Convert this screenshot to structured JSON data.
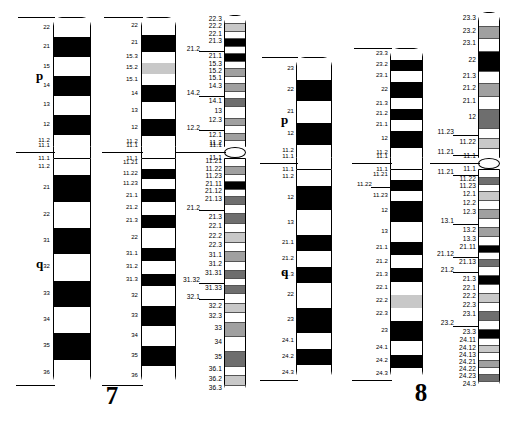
{
  "figure": {
    "type": "chromosome-ideogram",
    "arm_labels": {
      "p": "p",
      "q": "q"
    }
  },
  "chromosomes": [
    {
      "number": "7",
      "arms": {
        "p": "p",
        "q": "q"
      },
      "resolutions": [
        {
          "level": "400",
          "p_bands": [
            {
              "label": "22",
              "stain": "gneg"
            },
            {
              "label": "21",
              "stain": "gpos100"
            },
            {
              "label": "15",
              "stain": "gneg"
            },
            {
              "label": "14",
              "stain": "gpos100"
            },
            {
              "label": "13",
              "stain": "gneg"
            },
            {
              "label": "12",
              "stain": "gpos100"
            },
            {
              "label": "11.2",
              "stain": "gneg"
            },
            {
              "label": "11.1",
              "stain": "acen"
            }
          ],
          "q_bands": [
            {
              "label": "11.1",
              "stain": "acen"
            },
            {
              "label": "11.2",
              "stain": "gneg"
            },
            {
              "label": "21",
              "stain": "gpos100"
            },
            {
              "label": "22",
              "stain": "gneg"
            },
            {
              "label": "31",
              "stain": "gpos100"
            },
            {
              "label": "32",
              "stain": "gneg"
            },
            {
              "label": "33",
              "stain": "gpos100"
            },
            {
              "label": "34",
              "stain": "gneg"
            },
            {
              "label": "35",
              "stain": "gpos100"
            },
            {
              "label": "36",
              "stain": "gneg"
            }
          ]
        },
        {
          "level": "550",
          "p_bands": [
            {
              "label": "22",
              "stain": "gneg"
            },
            {
              "label": "21",
              "stain": "gpos100"
            },
            {
              "label": "15.3",
              "stain": "gneg"
            },
            {
              "label": "15.2",
              "stain": "gpos25"
            },
            {
              "label": "15.1",
              "stain": "gneg"
            },
            {
              "label": "14",
              "stain": "gpos100"
            },
            {
              "label": "13",
              "stain": "gneg"
            },
            {
              "label": "12",
              "stain": "gpos100"
            },
            {
              "label": "11.2",
              "stain": "gneg"
            },
            {
              "label": "11.1",
              "stain": "acen"
            }
          ],
          "q_bands": [
            {
              "label": "11.1",
              "stain": "acen"
            },
            {
              "label": "11.21",
              "stain": "gneg"
            },
            {
              "label": "11.22",
              "stain": "gpos100"
            },
            {
              "label": "11.23",
              "stain": "gneg"
            },
            {
              "label": "21.1",
              "stain": "gpos100"
            },
            {
              "label": "21.2",
              "stain": "gneg"
            },
            {
              "label": "21.3",
              "stain": "gpos100"
            },
            {
              "label": "22",
              "stain": "gneg"
            },
            {
              "label": "31.1",
              "stain": "gpos100"
            },
            {
              "label": "31.2",
              "stain": "gneg"
            },
            {
              "label": "31.3",
              "stain": "gpos100"
            },
            {
              "label": "32",
              "stain": "gneg"
            },
            {
              "label": "33",
              "stain": "gpos100"
            },
            {
              "label": "34",
              "stain": "gneg"
            },
            {
              "label": "35",
              "stain": "gpos100"
            },
            {
              "label": "36",
              "stain": "gneg"
            }
          ]
        },
        {
          "level": "850",
          "p_bands": [
            {
              "label": "22.3",
              "stain": "gneg"
            },
            {
              "label": "22.2",
              "stain": "gpos25"
            },
            {
              "label": "22.1",
              "stain": "gneg"
            },
            {
              "label": "21.3",
              "stain": "gpos100"
            },
            {
              "label": "21.2",
              "stain": "gneg",
              "offset": true
            },
            {
              "label": "21.1",
              "stain": "gpos100"
            },
            {
              "label": "15.3",
              "stain": "gneg"
            },
            {
              "label": "15.2",
              "stain": "gpos50"
            },
            {
              "label": "15.1",
              "stain": "gneg"
            },
            {
              "label": "14.3",
              "stain": "gpos50"
            },
            {
              "label": "14.2",
              "stain": "gneg",
              "offset": true
            },
            {
              "label": "14.1",
              "stain": "gpos75"
            },
            {
              "label": "13",
              "stain": "gneg"
            },
            {
              "label": "12.3",
              "stain": "gpos50"
            },
            {
              "label": "12.2",
              "stain": "gneg",
              "offset": true
            },
            {
              "label": "12.1",
              "stain": "gpos50"
            },
            {
              "label": "11.2",
              "stain": "gneg"
            },
            {
              "label": "11.1",
              "stain": "acen"
            }
          ],
          "q_bands": [
            {
              "label": "11.1",
              "stain": "acen"
            },
            {
              "label": "11.21",
              "stain": "gneg"
            },
            {
              "label": "11.22",
              "stain": "gpos50"
            },
            {
              "label": "11.23",
              "stain": "gneg"
            },
            {
              "label": "21.11",
              "stain": "gpos100"
            },
            {
              "label": "21.12",
              "stain": "gneg"
            },
            {
              "label": "21.13",
              "stain": "gpos75"
            },
            {
              "label": "21.2",
              "stain": "gneg",
              "offset": true
            },
            {
              "label": "21.3",
              "stain": "gpos75"
            },
            {
              "label": "22.1",
              "stain": "gneg"
            },
            {
              "label": "22.2",
              "stain": "gpos25"
            },
            {
              "label": "22.3",
              "stain": "gneg"
            },
            {
              "label": "31.1",
              "stain": "gpos50"
            },
            {
              "label": "31.2",
              "stain": "gneg"
            },
            {
              "label": "31.31",
              "stain": "gpos75"
            },
            {
              "label": "31.32",
              "stain": "gneg",
              "offset": true
            },
            {
              "label": "31.33",
              "stain": "gpos75"
            },
            {
              "label": "32.1",
              "stain": "gneg",
              "offset": true
            },
            {
              "label": "32.2",
              "stain": "gpos25"
            },
            {
              "label": "32.3",
              "stain": "gneg"
            },
            {
              "label": "33",
              "stain": "gpos50"
            },
            {
              "label": "34",
              "stain": "gneg"
            },
            {
              "label": "35",
              "stain": "gpos75"
            },
            {
              "label": "36.1",
              "stain": "gneg"
            },
            {
              "label": "36.2",
              "stain": "gpos25"
            },
            {
              "label": "36.3",
              "stain": "gneg"
            }
          ]
        }
      ]
    },
    {
      "number": "8",
      "arms": {
        "p": "p",
        "q": "q"
      },
      "resolutions": [
        {
          "level": "400",
          "p_bands": [
            {
              "label": "23",
              "stain": "gneg"
            },
            {
              "label": "22",
              "stain": "gpos100"
            },
            {
              "label": "21",
              "stain": "gneg"
            },
            {
              "label": "12",
              "stain": "gpos100"
            },
            {
              "label": "11.2",
              "stain": "gneg"
            },
            {
              "label": "11.1",
              "stain": "acen"
            }
          ],
          "q_bands": [
            {
              "label": "11.1",
              "stain": "acen"
            },
            {
              "label": "11.2",
              "stain": "gneg"
            },
            {
              "label": "12",
              "stain": "gpos100"
            },
            {
              "label": "13",
              "stain": "gneg"
            },
            {
              "label": "21.1",
              "stain": "gpos100"
            },
            {
              "label": "21.2",
              "stain": "gneg"
            },
            {
              "label": "21.3",
              "stain": "gpos100"
            },
            {
              "label": "22",
              "stain": "gneg"
            },
            {
              "label": "23",
              "stain": "gpos100"
            },
            {
              "label": "24.1",
              "stain": "gneg"
            },
            {
              "label": "24.2",
              "stain": "gpos100"
            },
            {
              "label": "24.3",
              "stain": "gneg"
            }
          ]
        },
        {
          "level": "550",
          "p_bands": [
            {
              "label": "23.3",
              "stain": "gneg"
            },
            {
              "label": "23.2",
              "stain": "gpos100"
            },
            {
              "label": "23.1",
              "stain": "gneg"
            },
            {
              "label": "22",
              "stain": "gpos100"
            },
            {
              "label": "21.3",
              "stain": "gneg"
            },
            {
              "label": "21.2",
              "stain": "gpos100"
            },
            {
              "label": "21.1",
              "stain": "gneg"
            },
            {
              "label": "12",
              "stain": "gpos100"
            },
            {
              "label": "11.2",
              "stain": "gneg"
            },
            {
              "label": "11.1",
              "stain": "acen"
            }
          ],
          "q_bands": [
            {
              "label": "11.1",
              "stain": "acen"
            },
            {
              "label": "11.21",
              "stain": "gneg"
            },
            {
              "label": "11.22",
              "stain": "gpos100",
              "offset": true
            },
            {
              "label": "11.23",
              "stain": "gneg"
            },
            {
              "label": "12",
              "stain": "gpos100"
            },
            {
              "label": "13",
              "stain": "gneg"
            },
            {
              "label": "21.1",
              "stain": "gpos100"
            },
            {
              "label": "21.2",
              "stain": "gneg"
            },
            {
              "label": "21.3",
              "stain": "gpos100"
            },
            {
              "label": "22.1",
              "stain": "gneg"
            },
            {
              "label": "22.2",
              "stain": "gpos25"
            },
            {
              "label": "22.3",
              "stain": "gneg"
            },
            {
              "label": "23",
              "stain": "gpos100"
            },
            {
              "label": "24.1",
              "stain": "gneg"
            },
            {
              "label": "24.2",
              "stain": "gpos100"
            },
            {
              "label": "24.3",
              "stain": "gneg"
            }
          ]
        },
        {
          "level": "850",
          "p_bands": [
            {
              "label": "23.3",
              "stain": "gneg"
            },
            {
              "label": "23.2",
              "stain": "gpos50"
            },
            {
              "label": "23.1",
              "stain": "gneg"
            },
            {
              "label": "22",
              "stain": "gpos100"
            },
            {
              "label": "21.3",
              "stain": "gneg"
            },
            {
              "label": "21.2",
              "stain": "gpos50"
            },
            {
              "label": "21.1",
              "stain": "gneg"
            },
            {
              "label": "12",
              "stain": "gpos75"
            },
            {
              "label": "11.23",
              "stain": "gneg",
              "offset": true
            },
            {
              "label": "11.22",
              "stain": "gpos25"
            },
            {
              "label": "11.21",
              "stain": "gneg",
              "offset": true
            },
            {
              "label": "11.1",
              "stain": "acen"
            }
          ],
          "q_bands": [
            {
              "label": "11.1",
              "stain": "acen"
            },
            {
              "label": "11.21",
              "stain": "gneg",
              "offset": true
            },
            {
              "label": "11.22",
              "stain": "gpos75"
            },
            {
              "label": "11.23",
              "stain": "gneg"
            },
            {
              "label": "12.1",
              "stain": "gpos25"
            },
            {
              "label": "12.2",
              "stain": "gneg"
            },
            {
              "label": "12.3",
              "stain": "gpos50"
            },
            {
              "label": "13.1",
              "stain": "gneg",
              "offset": true
            },
            {
              "label": "13.2",
              "stain": "gpos50"
            },
            {
              "label": "13.3",
              "stain": "gneg"
            },
            {
              "label": "21.11",
              "stain": "gpos100"
            },
            {
              "label": "21.12",
              "stain": "gneg",
              "offset": true
            },
            {
              "label": "21.13",
              "stain": "gpos75"
            },
            {
              "label": "21.2",
              "stain": "gneg",
              "offset": true
            },
            {
              "label": "21.3",
              "stain": "gpos100"
            },
            {
              "label": "22.1",
              "stain": "gneg"
            },
            {
              "label": "22.2",
              "stain": "gpos25"
            },
            {
              "label": "22.3",
              "stain": "gneg"
            },
            {
              "label": "23.1",
              "stain": "gpos75"
            },
            {
              "label": "23.2",
              "stain": "gneg",
              "offset": true
            },
            {
              "label": "23.3",
              "stain": "gpos100"
            },
            {
              "label": "24.11",
              "stain": "gneg"
            },
            {
              "label": "24.12",
              "stain": "gpos25"
            },
            {
              "label": "24.13",
              "stain": "gneg"
            },
            {
              "label": "24.21",
              "stain": "gpos50"
            },
            {
              "label": "24.22",
              "stain": "gneg"
            },
            {
              "label": "24.23",
              "stain": "gpos75"
            },
            {
              "label": "24.3",
              "stain": "gneg"
            }
          ]
        }
      ]
    }
  ]
}
